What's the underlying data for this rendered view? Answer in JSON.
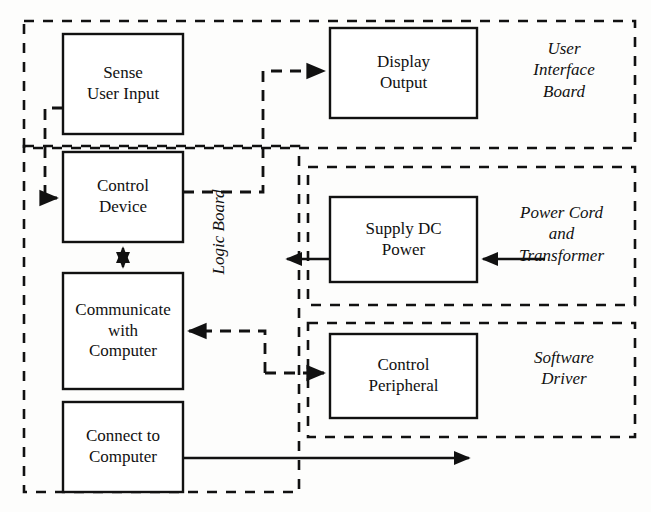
{
  "diagram": {
    "colors": {
      "stroke": "#111111",
      "background": "#fdfdfc",
      "box_fill": "#ffffff"
    },
    "nodes": [
      {
        "id": "sense-user-input",
        "label": "Sense\nUser Input",
        "x": 63,
        "y": 34,
        "w": 120,
        "h": 100
      },
      {
        "id": "display-output",
        "label": "Display\nOutput",
        "x": 330,
        "y": 28,
        "w": 147,
        "h": 90
      },
      {
        "id": "control-device",
        "label": "Control\nDevice",
        "x": 63,
        "y": 152,
        "w": 120,
        "h": 90
      },
      {
        "id": "supply-dc-power",
        "label": "Supply DC\nPower",
        "x": 330,
        "y": 197,
        "w": 147,
        "h": 85
      },
      {
        "id": "communicate-with-computer",
        "label": "Communicate\nwith\nComputer",
        "x": 63,
        "y": 273,
        "w": 120,
        "h": 116
      },
      {
        "id": "control-peripheral",
        "label": "Control\nPeripheral",
        "x": 330,
        "y": 334,
        "w": 147,
        "h": 84
      },
      {
        "id": "connect-to-computer",
        "label": "Connect to\nComputer",
        "x": 63,
        "y": 402,
        "w": 120,
        "h": 90
      }
    ],
    "regions": [
      {
        "id": "user-interface-board",
        "label": "User\nInterface\nBoard",
        "x": 24,
        "y": 21,
        "w": 611,
        "h": 127,
        "label_x": 505,
        "label_y": 38,
        "label_w": 118,
        "orientation": "horizontal"
      },
      {
        "id": "logic-board",
        "label": "Logic Board",
        "x": 24,
        "y": 146,
        "w": 275,
        "h": 346,
        "label_x": 206,
        "label_y": 190,
        "label_w": 18,
        "orientation": "vertical"
      },
      {
        "id": "power-cord-and-transformer",
        "label": "Power Cord\nand\nTransformer",
        "x": 308,
        "y": 167,
        "w": 327,
        "h": 138,
        "label_x": 495,
        "label_y": 202,
        "label_w": 133,
        "orientation": "horizontal"
      },
      {
        "id": "software-driver",
        "label": "Software\nDriver",
        "x": 308,
        "y": 323,
        "w": 327,
        "h": 114,
        "label_x": 505,
        "label_y": 347,
        "label_w": 118,
        "orientation": "horizontal"
      }
    ],
    "connections": [
      {
        "id": "sense-to-control-device",
        "style": "dashed",
        "from": "sense-user-input",
        "to": "control-device",
        "arrows": "single"
      },
      {
        "id": "control-device-to-display-output",
        "style": "dashed",
        "from": "control-device",
        "to": "display-output",
        "arrows": "single"
      },
      {
        "id": "control-device-communicate-bidir",
        "style": "solid",
        "from": "control-device",
        "to": "communicate-with-computer",
        "arrows": "double"
      },
      {
        "id": "control-peripheral-to-communicate",
        "style": "dashed",
        "from": "control-peripheral",
        "to": "communicate-with-computer",
        "arrows": "single"
      },
      {
        "id": "communicate-to-control-peripheral",
        "style": "dashed",
        "from": "communicate-with-computer",
        "to": "control-peripheral",
        "arrows": "single"
      },
      {
        "id": "supply-dc-power-output",
        "style": "solid",
        "from": "supply-dc-power",
        "to": "logic-board",
        "arrows": "single"
      },
      {
        "id": "power-cord-input",
        "style": "solid",
        "from": "power-cord-and-transformer",
        "to": "supply-dc-power",
        "arrows": "single"
      },
      {
        "id": "connect-to-computer-output",
        "style": "solid",
        "from": "connect-to-computer",
        "to": "external-computer",
        "arrows": "single"
      }
    ]
  }
}
